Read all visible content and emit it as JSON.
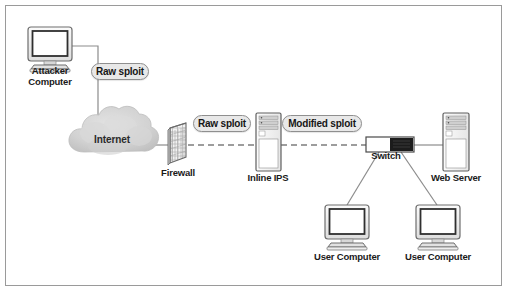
{
  "figure": {
    "background_color": "#ffffff",
    "border_color": "#9a9a9a"
  },
  "nodes": {
    "attacker": {
      "label": "Attacker\nComputer",
      "icon": "crt-monitor-icon"
    },
    "internet": {
      "label": "Internet",
      "icon": "cloud-icon"
    },
    "firewall": {
      "label": "Firewall",
      "icon": "brick-wall-icon"
    },
    "inline_ips": {
      "label": "Inline IPS",
      "icon": "server-tower-icon"
    },
    "switch": {
      "label": "Switch",
      "icon": "network-switch-icon"
    },
    "web_server": {
      "label": "Web Server",
      "icon": "server-tower-icon"
    },
    "user_computer_left": {
      "label": "User Computer",
      "icon": "crt-monitor-icon"
    },
    "user_computer_right": {
      "label": "User Computer",
      "icon": "crt-monitor-icon"
    }
  },
  "annotations": {
    "raw_sploit_top": "Raw sploit",
    "raw_sploit_mid": "Raw sploit",
    "modified_sploit": "Modified sploit"
  },
  "colors": {
    "line": "#8c8c8c",
    "dashed_line": "#3c3c3c",
    "pill_fill": "#e8e8e8",
    "pill_border": "#8f8f8f",
    "cloud_fill": "#d4d4d4",
    "switch_dark": "#1c1c1c",
    "text": "#1a1a1a"
  }
}
